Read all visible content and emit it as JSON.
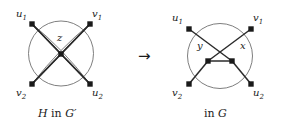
{
  "figure": {
    "left_graph": {
      "caption_prefix": "H",
      "caption_middle": " in ",
      "caption_suffix": "G′",
      "caption_full": "H in G′",
      "vertex_labels": {
        "top_left": "u",
        "top_left_sub": "1",
        "top_right": "v",
        "top_right_sub": "1",
        "bottom_left": "v",
        "bottom_left_sub": "2",
        "bottom_right": "u",
        "bottom_right_sub": "2",
        "center": "z"
      }
    },
    "right_graph": {
      "caption_prefix": "",
      "caption_middle": "in ",
      "caption_suffix": "G",
      "caption_full": "in G",
      "vertex_labels": {
        "top_left": "u",
        "top_left_sub": "1",
        "top_right": "v",
        "top_right_sub": "1",
        "bottom_left": "v",
        "bottom_left_sub": "2",
        "bottom_right": "u",
        "bottom_right_sub": "2",
        "mid_left": "y",
        "mid_right": "x"
      }
    },
    "arrow": "→",
    "colors": {
      "stroke": "#2b2b2b",
      "circle_stroke": "#6f6f6f",
      "vertex_fill": "#1a1a1a",
      "text": "#1a1a1a",
      "background": "#ffffff"
    }
  }
}
